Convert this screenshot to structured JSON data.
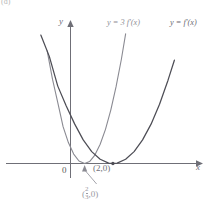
{
  "figure": {
    "panel_tag": "(d)",
    "axis_x_label": "x",
    "axis_y_label": "y",
    "origin_label": "0"
  },
  "legend": [
    {
      "name": "scaled-derivative",
      "text": "y = 3 f'(x)",
      "color": "#8e8e96"
    },
    {
      "name": "derivative",
      "text": "y = f'(x)",
      "color": "#6a6a72"
    }
  ],
  "annotations": {
    "point_two": "(2,0)",
    "fraction_point": {
      "open": "(",
      "numerator": "2",
      "denominator": "3",
      "rest": ",0)"
    }
  },
  "chart_data": {
    "type": "line",
    "title": "",
    "xlabel": "x",
    "ylabel": "y",
    "xlim": [
      -3.2,
      5.6
    ],
    "ylim": [
      -0.6,
      7.2
    ],
    "grid": false,
    "legend_position": "top-right",
    "annotations": [
      {
        "text": "(2,0)",
        "x": 2.0,
        "y": 0.0
      },
      {
        "text": "(2/3,0)",
        "x": 0.6667,
        "y": 0.0,
        "leader": true
      }
    ],
    "series": [
      {
        "name": "y = f'(x)",
        "color": "#4d4d55",
        "width": 1.25,
        "equation": "y = 0.62*(x-2)^2",
        "vertex": [
          2.0,
          0.0
        ],
        "x": [
          -2.55,
          -2.2,
          -1.8,
          -1.4,
          -1.0,
          -0.6,
          -0.2,
          0.2,
          0.6,
          1.0,
          1.4,
          1.8,
          2.0,
          2.2,
          2.6,
          3.0,
          3.4,
          3.8,
          4.2,
          4.6,
          4.9
        ],
        "values": [
          12.6,
          10.4,
          8.43,
          6.69,
          5.58,
          4.03,
          2.99,
          2.05,
          1.23,
          0.62,
          0.22,
          0.02,
          0.0,
          0.02,
          0.22,
          0.62,
          1.23,
          2.05,
          3.09,
          4.34,
          5.38
        ]
      },
      {
        "name": "y = 3 f'(x)",
        "color": "#8a8a92",
        "width": 1.1,
        "equation": "y = 1.86*(x-2/3)^2",
        "vertex": [
          0.6667,
          0.0
        ],
        "x": [
          -1.35,
          -1.1,
          -0.85,
          -0.6,
          -0.35,
          -0.1,
          0.15,
          0.4,
          0.667,
          0.9,
          1.15,
          1.4,
          1.65,
          1.9,
          2.15,
          2.4,
          2.6
        ],
        "values": [
          7.5,
          5.87,
          4.39,
          3.17,
          1.92,
          1.09,
          0.49,
          0.13,
          0.0,
          0.1,
          0.44,
          1.0,
          1.78,
          2.78,
          4.0,
          5.43,
          6.75
        ]
      }
    ]
  }
}
